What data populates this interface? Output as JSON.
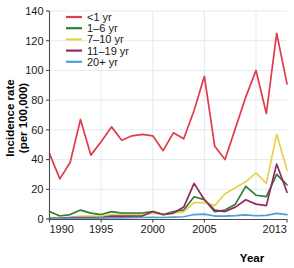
{
  "chart_data": {
    "type": "line",
    "title": "",
    "xlabel": "Year",
    "ylabel": "Incidence rate (per 100,000)",
    "ylabel_line1": "Incidence rate",
    "ylabel_line2": "(per 100,000)",
    "xlim": [
      1990,
      2013
    ],
    "ylim": [
      0,
      140
    ],
    "grid": true,
    "legend_position": "top-left",
    "x": [
      1990,
      1991,
      1992,
      1993,
      1994,
      1995,
      1996,
      1997,
      1998,
      1999,
      2000,
      2001,
      2002,
      2003,
      2004,
      2005,
      2006,
      2007,
      2008,
      2009,
      2010,
      2011,
      2012,
      2013
    ],
    "xticks": [
      1990,
      1995,
      2000,
      2005,
      2013
    ],
    "xtick_labels": [
      "1990",
      "1995",
      "2000",
      "2005",
      "2013"
    ],
    "yticks": [
      0,
      20,
      40,
      60,
      80,
      100,
      120,
      140
    ],
    "ytick_labels": [
      "0",
      "20",
      "40",
      "60",
      "80",
      "100",
      "120",
      "140"
    ],
    "series": [
      {
        "name": "<1 yr",
        "color": "#e13a4b",
        "values": [
          44,
          27,
          38,
          67,
          43,
          52,
          62,
          53,
          56,
          57,
          56,
          46,
          58,
          54,
          73,
          96,
          49,
          40,
          61,
          82,
          100,
          71,
          125,
          91
        ]
      },
      {
        "name": "1–6 yr",
        "color": "#2f7d35",
        "values": [
          5,
          2,
          3,
          6,
          4,
          3,
          5,
          4,
          4,
          4,
          5,
          3,
          5,
          6,
          15,
          13,
          5,
          6,
          10,
          22,
          16,
          15,
          30,
          23
        ]
      },
      {
        "name": "7–10 yr",
        "color": "#e6d24e",
        "values": [
          1,
          1,
          1,
          2,
          2,
          2,
          3,
          3,
          3,
          3,
          4,
          3,
          4,
          5,
          11,
          11,
          9,
          17,
          21,
          25,
          31,
          24,
          57,
          33
        ]
      },
      {
        "name": "11–19 yr",
        "color": "#8f2b5f",
        "values": [
          0.5,
          0.5,
          1,
          1,
          1,
          1,
          2,
          2,
          2,
          2,
          5,
          3,
          4,
          8,
          24,
          13,
          6,
          5,
          8,
          13,
          10,
          9,
          37,
          18
        ]
      },
      {
        "name": "20+ yr",
        "color": "#4a9fd6",
        "values": [
          0.3,
          0.3,
          0.4,
          0.5,
          0.5,
          0.6,
          0.7,
          0.8,
          0.9,
          1.0,
          1.1,
          1.0,
          1.2,
          1.5,
          3.0,
          3.3,
          2.0,
          2.0,
          2.3,
          2.8,
          2.2,
          2.5,
          3.8,
          3.0
        ]
      }
    ],
    "legend_entries": [
      {
        "label": "<1 yr",
        "color": "#e13a4b"
      },
      {
        "label": "1–6 yr",
        "color": "#2f7d35"
      },
      {
        "label": "7–10 yr",
        "color": "#e6d24e"
      },
      {
        "label": "11–19 yr",
        "color": "#8f2b5f"
      },
      {
        "label": "20+ yr",
        "color": "#4a9fd6"
      }
    ]
  },
  "colors": {
    "background": "#ffffff",
    "grid": "#d3e3ef",
    "axis": "#4d4d4d",
    "text": "#1a1a1a"
  }
}
